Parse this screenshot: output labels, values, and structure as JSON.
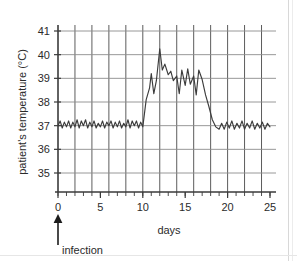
{
  "chart_data": {
    "type": "line",
    "title": "",
    "xlabel": "days",
    "ylabel": "patient's temperature (°C)",
    "xlim": [
      0,
      25
    ],
    "ylim": [
      34.3,
      41.4
    ],
    "grid": true,
    "legend": false,
    "x_ticks": [
      0,
      5,
      10,
      15,
      20,
      25
    ],
    "x_tick_labels": [
      "0",
      "5",
      "10",
      "15",
      "20",
      "25"
    ],
    "x_minor_tick_step": 1,
    "y_ticks": [
      35,
      36,
      37,
      38,
      39,
      40,
      41
    ],
    "y_tick_labels": [
      "35",
      "36",
      "37",
      "38",
      "39",
      "40",
      "41"
    ],
    "vertical_gridline_step": 2,
    "line_color": "#3c3c3c",
    "grid_color": "#8c8c8c",
    "annotations": [
      {
        "name": "infection",
        "label": "infection",
        "x": 0,
        "type": "up-arrow"
      }
    ],
    "series": [
      {
        "name": "patient temperature",
        "x": [
          0,
          0.25,
          0.5,
          0.75,
          1,
          1.25,
          1.5,
          1.75,
          2,
          2.25,
          2.5,
          2.75,
          3,
          3.25,
          3.5,
          3.75,
          4,
          4.25,
          4.5,
          4.75,
          5,
          5.25,
          5.5,
          5.75,
          6,
          6.25,
          6.5,
          6.75,
          7,
          7.25,
          7.5,
          7.75,
          8,
          8.25,
          8.5,
          8.75,
          9,
          9.25,
          9.5,
          9.75,
          10,
          10.4,
          10.8,
          11,
          11.3,
          11.6,
          12,
          12.3,
          12.6,
          13,
          13.3,
          13.6,
          14,
          14.3,
          14.6,
          15,
          15.3,
          15.6,
          16,
          16.3,
          16.6,
          17,
          17.4,
          17.8,
          18.2,
          18.6,
          19,
          19.3,
          19.6,
          19.9,
          20.2,
          20.5,
          20.8,
          21.1,
          21.4,
          21.7,
          22,
          22.3,
          22.6,
          22.9,
          23.2,
          23.5,
          23.8,
          24.1,
          24.4,
          24.7,
          25
        ],
        "values": [
          37.0,
          37.2,
          36.9,
          37.15,
          36.95,
          37.2,
          36.9,
          37.15,
          36.95,
          37.25,
          36.9,
          37.2,
          37.0,
          37.25,
          36.9,
          37.15,
          36.95,
          37.2,
          36.9,
          37.1,
          36.95,
          37.2,
          36.9,
          37.15,
          37.0,
          37.2,
          36.9,
          37.15,
          36.95,
          37.2,
          36.9,
          37.1,
          36.95,
          37.25,
          36.9,
          37.2,
          37.0,
          37.2,
          36.9,
          37.15,
          36.95,
          38.1,
          38.6,
          39.2,
          38.35,
          38.9,
          40.25,
          39.35,
          39.6,
          39.15,
          39.3,
          38.9,
          39.1,
          38.35,
          39.35,
          38.7,
          39.4,
          38.75,
          39.1,
          38.3,
          39.35,
          38.95,
          38.3,
          37.8,
          37.25,
          36.95,
          36.85,
          37.1,
          36.85,
          37.15,
          36.9,
          37.2,
          36.85,
          37.1,
          36.9,
          37.2,
          36.85,
          37.1,
          36.9,
          37.2,
          36.85,
          37.1,
          36.9,
          37.15,
          36.85,
          37.1,
          36.95
        ]
      }
    ]
  },
  "axes": {
    "y_title": "patient's temperature (°C)",
    "x_title": "days"
  },
  "annotation": {
    "infection_label": "infection"
  }
}
